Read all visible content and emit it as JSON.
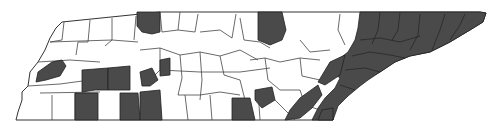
{
  "map": {
    "title": "",
    "region": "Tennessee counties",
    "colors": {
      "shaded": "#4a4a4a",
      "unshaded": "#ffffff",
      "border": "#333333",
      "background": "#ffffff"
    },
    "legend": []
  }
}
